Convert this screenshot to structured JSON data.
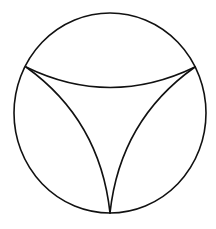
{
  "diagram": {
    "colors": {
      "background": "#ffffff",
      "stroke": "#111111"
    },
    "circle": {
      "cx": 110,
      "cy": 113,
      "rx": 96,
      "ry": 100
    },
    "vertices": [
      {
        "name": "left",
        "x": 26,
        "y": 67
      },
      {
        "name": "right",
        "x": 195,
        "y": 67
      },
      {
        "name": "bottom",
        "x": 110,
        "y": 213
      }
    ],
    "arcs": [
      {
        "name": "top-arc",
        "d": "M 26 67 Q 110 108 195 67"
      },
      {
        "name": "left-arc",
        "d": "M 26 67 Q 100 120 110 213"
      },
      {
        "name": "right-arc",
        "d": "M 195 67 Q 120 120 110 213"
      }
    ]
  }
}
